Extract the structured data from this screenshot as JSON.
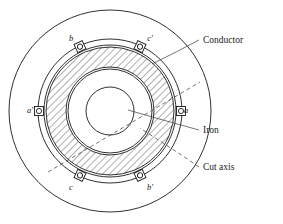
{
  "figure": {
    "background_color": "#ffffff",
    "line_color": "#1a1a1a"
  },
  "callouts": [
    {
      "key": "conductor",
      "label": "Conductor",
      "text_x": 203,
      "text_y": 43,
      "leader": "M 199 40 L 178 51 L 152 64",
      "style": "solid"
    },
    {
      "key": "iron",
      "label": "Iron",
      "text_x": 203,
      "text_y": 133,
      "leader": "M 199 130 L 170 122 L 128 110",
      "style": "solid"
    },
    {
      "key": "cut_axis",
      "label": "Cut axis",
      "text_x": 203,
      "text_y": 170,
      "leader": "M 199 167 L 183 156 L 140 128",
      "style": "dashed"
    }
  ],
  "terminals": [
    {
      "key": "b",
      "label": "b",
      "angle_deg": 115,
      "label_x": 71,
      "label_y": 41
    },
    {
      "key": "c_prime",
      "label": "c'",
      "angle_deg": 65,
      "label_x": 150,
      "label_y": 41
    },
    {
      "key": "a",
      "label": "a",
      "angle_deg": 0,
      "label_x": 186,
      "label_y": 113
    },
    {
      "key": "a_prime",
      "label": "a'",
      "angle_deg": 180,
      "label_x": 30,
      "label_y": 113
    },
    {
      "key": "b_prime",
      "label": "b'",
      "angle_deg": 295,
      "label_x": 150,
      "label_y": 190
    },
    {
      "key": "c",
      "label": "c",
      "angle_deg": 245,
      "label_x": 71,
      "label_y": 190
    }
  ],
  "geometry": {
    "center_x": 110,
    "center_y": 111,
    "outer_housing_radius": 101,
    "conductor_ring_outer_radius": 72,
    "conductor_ring_inner_radius": 66,
    "iron_outer_radius": 64,
    "iron_inner_radius": 44,
    "bore_radius": 42,
    "shaft_radius": 24,
    "terminal_box_size": 9,
    "terminal_hole_radius": 2.6,
    "hatch_angle_deg": 45
  },
  "cut_axis_line": {
    "x1": 48,
    "y1": 172,
    "x2": 200,
    "y2": 82,
    "style": "dashed"
  }
}
